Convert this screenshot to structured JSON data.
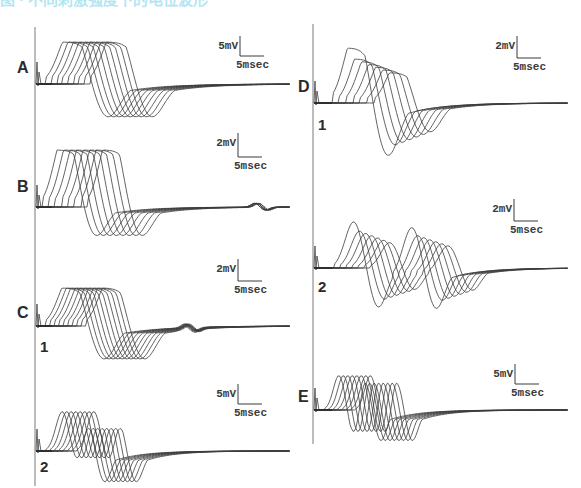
{
  "figure": {
    "title_visible_fragment": "图 · 不同刺激强度下的电位波形",
    "left_axis_x": 35,
    "right_axis_x": 313,
    "trace_color": "#3c3c3c",
    "title_color": "#29b6d8"
  },
  "panels": [
    {
      "id": "A",
      "label": "A",
      "sublabel": "",
      "label_pos": [
        17,
        73
      ],
      "baseline_y": 84,
      "x_start": 36,
      "x_end": 290,
      "onset_x": 50,
      "first_rise_x": 52,
      "shift_px": 5.5,
      "n_traces": 9,
      "peak_amp": 42,
      "trough_amp": 34,
      "width": 58,
      "recovery": 110,
      "double": false,
      "bipolar_first_big": false,
      "scale": {
        "x": 240,
        "y": 36,
        "v_label": "5mV",
        "t_label": "5msec",
        "v_len": 20,
        "t_len": 24
      }
    },
    {
      "id": "B",
      "label": "B",
      "sublabel": "",
      "label_pos": [
        17,
        192
      ],
      "baseline_y": 207,
      "x_start": 36,
      "x_end": 290,
      "onset_x": 50,
      "first_rise_x": 48,
      "shift_px": 6.5,
      "n_traces": 8,
      "peak_amp": 57,
      "trough_amp": 30,
      "width": 50,
      "recovery": 100,
      "double": false,
      "bipolar_first_big": false,
      "late_blip_x": 255,
      "scale": {
        "x": 238,
        "y": 133,
        "v_label": "2mV",
        "t_label": "5msec",
        "v_len": 24,
        "t_len": 24
      }
    },
    {
      "id": "C1",
      "label": "C",
      "sublabel": "1",
      "label_pos": [
        17,
        318
      ],
      "sublabel_pos": [
        40,
        352
      ],
      "baseline_y": 326,
      "x_start": 36,
      "x_end": 290,
      "onset_x": 50,
      "first_rise_x": 52,
      "shift_px": 4.5,
      "n_traces": 10,
      "peak_amp": 38,
      "trough_amp": 34,
      "width": 54,
      "recovery": 120,
      "double": false,
      "bipolar_first_big": false,
      "late_blip_x": 185,
      "scale": {
        "x": 238,
        "y": 259,
        "v_label": "2mV",
        "t_label": "5msec",
        "v_len": 22,
        "t_len": 24
      }
    },
    {
      "id": "C2",
      "label": "",
      "sublabel": "2",
      "sublabel_pos": [
        40,
        472
      ],
      "baseline_y": 451,
      "x_start": 36,
      "x_end": 290,
      "onset_x": 50,
      "first_rise_x": 52,
      "shift_px": 4.5,
      "n_traces": 8,
      "peak_amp": 40,
      "trough_amp": 28,
      "width": 30,
      "recovery": 80,
      "double": true,
      "second_offset": 24,
      "bipolar_first_big": false,
      "scale": {
        "x": 238,
        "y": 384,
        "v_label": "5mV",
        "t_label": "5msec",
        "v_len": 20,
        "t_len": 24
      }
    },
    {
      "id": "D1",
      "label": "D",
      "sublabel": "1",
      "label_pos": [
        298,
        92
      ],
      "sublabel_pos": [
        318,
        130
      ],
      "baseline_y": 103,
      "x_start": 314,
      "x_end": 568,
      "onset_x": 330,
      "first_rise_x": 338,
      "shift_px": 7,
      "n_traces": 7,
      "peak_amp": 55,
      "trough_amp": 54,
      "width": 52,
      "recovery": 100,
      "double": false,
      "bipolar_first_big": true,
      "scale": {
        "x": 517,
        "y": 36,
        "v_label": "2mV",
        "t_label": "5msec",
        "v_len": 22,
        "t_len": 24
      }
    },
    {
      "id": "D2",
      "label": "",
      "sublabel": "2",
      "sublabel_pos": [
        318,
        292
      ],
      "baseline_y": 268,
      "x_start": 314,
      "x_end": 568,
      "onset_x": 330,
      "first_rise_x": 340,
      "shift_px": 6,
      "n_traces": 7,
      "peak_amp": 47,
      "trough_amp": 40,
      "width": 40,
      "recovery": 90,
      "double": true,
      "second_offset": 58,
      "bipolar_first_big": true,
      "scale": {
        "x": 514,
        "y": 199,
        "v_label": "2mV",
        "t_label": "5msec",
        "v_len": 22,
        "t_len": 24
      }
    },
    {
      "id": "E",
      "label": "E",
      "sublabel": "",
      "label_pos": [
        298,
        402
      ],
      "baseline_y": 410,
      "x_start": 314,
      "x_end": 568,
      "onset_x": 330,
      "first_rise_x": 330,
      "shift_px": 4.5,
      "n_traces": 8,
      "peak_amp": 35,
      "trough_amp": 28,
      "width": 26,
      "recovery": 80,
      "double": true,
      "second_offset": 26,
      "bipolar_first_big": false,
      "scale": {
        "x": 515,
        "y": 364,
        "v_label": "5mV",
        "t_label": "5msec",
        "v_len": 20,
        "t_len": 24
      }
    }
  ]
}
